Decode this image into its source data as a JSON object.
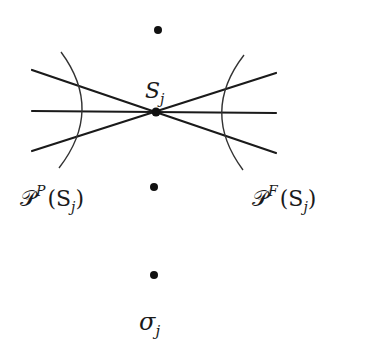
{
  "diagram": {
    "colors": {
      "stroke": "#1a1a1a",
      "background": "#ffffff"
    },
    "points": [
      {
        "id": "top-dot",
        "x": 158,
        "y": 30
      },
      {
        "id": "sj-dot",
        "x": 156,
        "y": 112
      },
      {
        "id": "middle-dot",
        "x": 154,
        "y": 187
      },
      {
        "id": "sigma-dot",
        "x": 154,
        "y": 275
      }
    ],
    "lines": [
      {
        "x1": 32,
        "y1": 70,
        "x2": 276,
        "y2": 153
      },
      {
        "x1": 32,
        "y1": 111,
        "x2": 276,
        "y2": 113
      },
      {
        "x1": 32,
        "y1": 151,
        "x2": 276,
        "y2": 73
      }
    ],
    "arcs": [
      {
        "id": "past-arc",
        "path": "M61,52 Q104,110 59,168"
      },
      {
        "id": "future-arc",
        "path": "M244,55 Q200,112 243,170"
      }
    ],
    "labels": {
      "s_j": {
        "main": "S",
        "sub": "j"
      },
      "past_cone": {
        "script": "𝒫",
        "sup": "P",
        "args": "(S",
        "sub": "j",
        "close": ")"
      },
      "future_cone": {
        "script": "𝒫",
        "sup": "F",
        "args": "(S",
        "sub": "j",
        "close": ")"
      },
      "sigma_j": {
        "main": "σ",
        "sub": "j"
      }
    }
  }
}
